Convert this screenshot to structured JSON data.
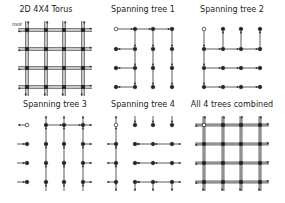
{
  "figure": {
    "panels": [
      {
        "id": "torus",
        "title": "2D 4X4 Torus",
        "cx": 46,
        "titleY": 11,
        "cols": [
          27,
          46,
          64,
          83
        ],
        "rows": [
          30,
          49,
          68,
          87
        ],
        "type": "torus"
      },
      {
        "id": "tree1",
        "title": "Spanning tree 1",
        "cx": 143,
        "titleY": 11,
        "cols": [
          116,
          135,
          153,
          172
        ],
        "rows": [
          29,
          49,
          68,
          87
        ],
        "type": "tree1"
      },
      {
        "id": "tree2",
        "title": "Spanning tree 2",
        "cx": 232,
        "titleY": 11,
        "cols": [
          204,
          223,
          241,
          260
        ],
        "rows": [
          29,
          49,
          68,
          87
        ],
        "type": "tree2"
      },
      {
        "id": "tree3",
        "title": "Spanning tree 3",
        "cx": 55,
        "titleY": 105,
        "cols": [
          27,
          46,
          64,
          83
        ],
        "rows": [
          125,
          144,
          163,
          182
        ],
        "type": "tree3"
      },
      {
        "id": "tree4",
        "title": "Spanning tree 4",
        "cx": 143,
        "titleY": 105,
        "cols": [
          116,
          135,
          153,
          172
        ],
        "rows": [
          125,
          144,
          163,
          182
        ],
        "type": "tree4"
      },
      {
        "id": "combined",
        "title": "All 4 trees combined",
        "cx": 232,
        "titleY": 105,
        "cols": [
          204,
          223,
          241,
          260
        ],
        "rows": [
          125,
          144,
          163,
          182
        ],
        "type": "combined"
      }
    ],
    "root_label": "root",
    "colors": {
      "edge": "#333333",
      "node": "#222222",
      "root_fill": "#ffffff"
    }
  }
}
